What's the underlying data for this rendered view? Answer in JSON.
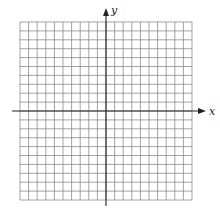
{
  "figure": {
    "type": "blank coordinate grid",
    "grid": {
      "columns": 20,
      "rows": 20,
      "x_range": [
        -10,
        10
      ],
      "y_range": [
        -10,
        10
      ],
      "line_color": "#8a8a8a"
    },
    "axes": {
      "x_label": "x",
      "y_label": "y",
      "x_arrow": "right",
      "y_arrow": "up",
      "axis_color": "#222222"
    }
  }
}
